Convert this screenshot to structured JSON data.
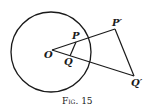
{
  "figure": {
    "caption": "Fig. 15",
    "labels": {
      "O": "O",
      "P": "P",
      "Q": "Q",
      "P_prime": "P′",
      "Q_prime": "Q′"
    },
    "colors": {
      "stroke": "#1a1a1a",
      "background": "#ffffff"
    }
  }
}
